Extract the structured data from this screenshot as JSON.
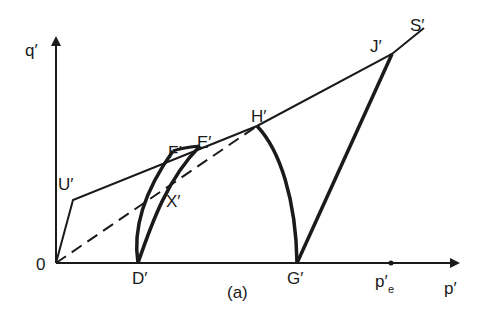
{
  "figure": {
    "caption": "(a)",
    "axes": {
      "x_label": "p′",
      "y_label": "q′",
      "origin_label": "0"
    },
    "points": {
      "U": "U′",
      "F": "F′",
      "E": "E′",
      "X": "X′",
      "H": "H′",
      "J": "J′",
      "S": "S′",
      "D": "D′",
      "G": "G′",
      "pe_main": "p′",
      "pe_sub": "e"
    },
    "colors": {
      "ink": "#1a1a1a",
      "background": "#ffffff"
    }
  }
}
